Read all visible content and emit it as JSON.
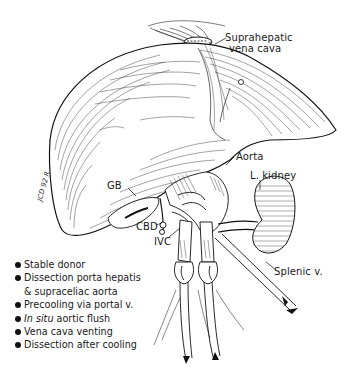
{
  "figure": {
    "type": "anatomical-illustration",
    "labels": {
      "suprahepatic_line1": "Suprahepatic",
      "suprahepatic_line2": "vena cava",
      "aorta": "Aorta",
      "l_kidney": "L. kidney",
      "gb": "GB",
      "cbd": "CBD",
      "ivc": "IVC",
      "splenic_v": "Splenic v."
    },
    "signature": "JCD 92 R",
    "steps": [
      {
        "text": "Stable donor"
      },
      {
        "text": "Dissection porta hepatis",
        "continuation": "& supraceliac aorta"
      },
      {
        "text": "Precooling via portal v."
      },
      {
        "italic_prefix": "In situ",
        "text": " aortic flush"
      },
      {
        "text": "Vena cava venting"
      },
      {
        "text": "Dissection after cooling"
      }
    ],
    "colors": {
      "ink": "#111111",
      "background": "#ffffff"
    }
  }
}
